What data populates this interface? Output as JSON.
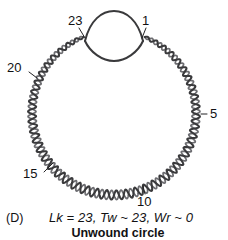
{
  "figure": {
    "panel_letter": "(D)",
    "formula": "Lk = 23, Tw ~ 23, Wr ~ 0",
    "subtitle": "Unwound circle",
    "stroke_color": "#3a3a3c",
    "stroke_color_light": "#6e6e72",
    "background_color": "#ffffff",
    "text_color": "#111113"
  },
  "diagram": {
    "type": "dna-topology",
    "shape": "circular-duplex-with-unwound-bubble",
    "center": {
      "x": 114,
      "y": 113
    },
    "radius": 82,
    "bubble": {
      "name": "unwound-region",
      "left_anchor": {
        "x": 85,
        "y": 41
      },
      "right_anchor": {
        "x": 143,
        "y": 41
      },
      "top_apex": {
        "x": 114,
        "y": 12
      },
      "bottom_apex": {
        "x": 114,
        "y": 60
      }
    },
    "helix": {
      "turns": 23,
      "crossovers_drawn": 46
    }
  },
  "tick_labels": [
    {
      "id": "label-23",
      "text": "23",
      "x": 68,
      "y": 14,
      "leader": {
        "x1": 79,
        "y1": 28,
        "x2": 85,
        "y2": 38
      }
    },
    {
      "id": "label-1",
      "text": "1",
      "x": 142,
      "y": 14,
      "leader": {
        "x1": 146,
        "y1": 28,
        "x2": 142,
        "y2": 38
      }
    },
    {
      "id": "label-5",
      "text": "5",
      "x": 210,
      "y": 108,
      "leader": {
        "x1": 201,
        "y1": 114,
        "x2": 207,
        "y2": 114
      }
    },
    {
      "id": "label-10",
      "text": "10",
      "x": 138,
      "y": 196,
      "leader": {
        "x1": 143,
        "y1": 186,
        "x2": 145,
        "y2": 194
      }
    },
    {
      "id": "label-15",
      "text": "15",
      "x": 24,
      "y": 168,
      "leader": {
        "x1": 44,
        "y1": 172,
        "x2": 53,
        "y2": 163
      }
    },
    {
      "id": "label-20",
      "text": "20",
      "x": 8,
      "y": 62,
      "leader": {
        "x1": 29,
        "y1": 72,
        "x2": 37,
        "y2": 78
      }
    }
  ],
  "chart_data": {
    "type": "diagram",
    "title": "Unwound circle",
    "annotations": [
      "23",
      "1",
      "5",
      "10",
      "15",
      "20"
    ],
    "values": {
      "Lk": 23,
      "Tw": 23,
      "Wr": 0
    }
  }
}
